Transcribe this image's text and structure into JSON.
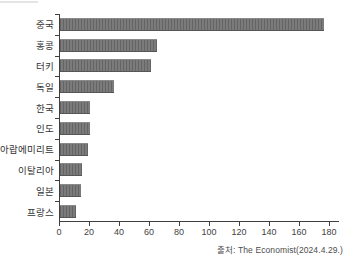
{
  "chart_data": {
    "type": "bar",
    "orientation": "horizontal",
    "title": "",
    "xlabel": "",
    "ylabel": "",
    "categories": [
      "중국",
      "홍콩",
      "터키",
      "독일",
      "한국",
      "인도",
      "아랍에미리트",
      "이탈리아",
      "일본",
      "프랑스"
    ],
    "values": [
      176,
      65,
      61,
      36,
      20,
      20,
      19,
      15,
      14,
      11
    ],
    "x_ticks": [
      0,
      20,
      40,
      60,
      80,
      100,
      120,
      140,
      160,
      180
    ],
    "xlim": [
      0,
      187
    ],
    "grid": false,
    "legend": "none",
    "bar_color": "#6e6e6e",
    "axis_color": "#3f3f3f"
  },
  "caption": {
    "source": "출처: The Economist(2024.4.29.)"
  }
}
